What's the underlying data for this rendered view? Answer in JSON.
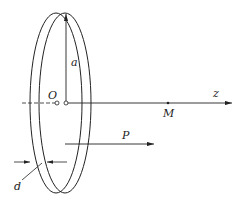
{
  "diagram": {
    "labels": {
      "radius": "a",
      "origin": "O",
      "axis": "z",
      "point": "M",
      "polarization": "P",
      "thickness": "d"
    },
    "colors": {
      "stroke": "#222222",
      "background": "#ffffff"
    }
  }
}
